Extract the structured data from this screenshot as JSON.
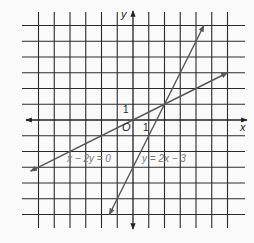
{
  "chart_data": {
    "type": "line",
    "title": "",
    "xlabel": "x",
    "ylabel": "y",
    "origin_label": "O",
    "tick_labels": {
      "x_one": "1",
      "y_one": "1"
    },
    "xlim": [
      -7,
      6
    ],
    "ylim": [
      -7,
      6.5
    ],
    "grid": true,
    "series": [
      {
        "name": "x − 2y = 0",
        "equation": "x - 2y = 0",
        "label": "x − 2y = 0",
        "points": [
          [
            -6.5,
            -3.25
          ],
          [
            6,
            3
          ]
        ],
        "color": "#555555"
      },
      {
        "name": "y = 2x − 3",
        "equation": "y = 2x - 3",
        "label": "y = 2x − 3",
        "points": [
          [
            -1.5,
            -6
          ],
          [
            4.5,
            6
          ]
        ],
        "color": "#555555"
      }
    ],
    "intersection": [
      2,
      1
    ]
  },
  "style": {
    "grid_color": "#2a2a2a",
    "line_color": "#5a5a5a",
    "label_color": "#7a7a7a",
    "background": "#fafafa"
  }
}
